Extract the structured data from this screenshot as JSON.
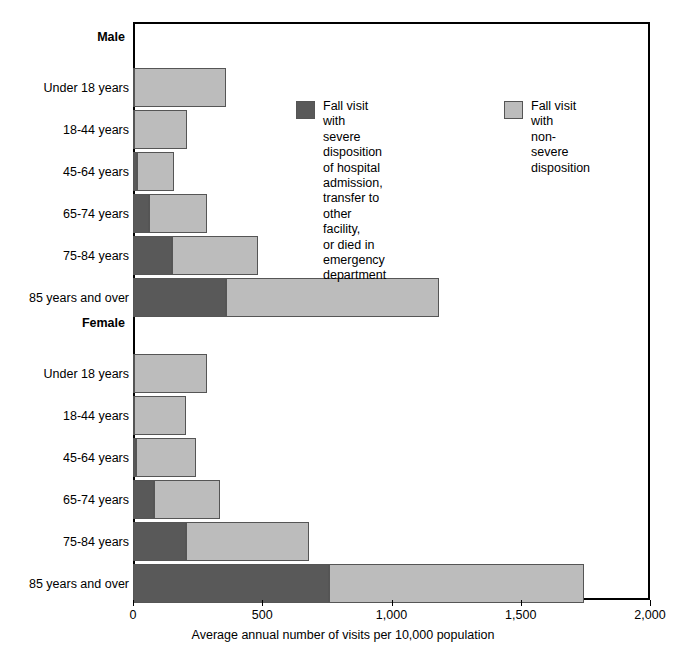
{
  "axis": {
    "x_title": "Average annual number of visits per 10,000 population",
    "ticks": [
      "0",
      "500",
      "1,000",
      "1,500",
      "2,000"
    ]
  },
  "legend": {
    "severe_label": "Fall visit with\nsevere disposition\nof hospital admission,\ntransfer to other facility,\nor died in emergency\ndepartment",
    "nonsevere_label": "Fall visit with\nnon-severe disposition",
    "severe_color": "#595959",
    "nonsevere_color": "#bcbcbc"
  },
  "groups": [
    {
      "name": "Male"
    },
    {
      "name": "Female"
    }
  ],
  "categories": [
    "Under 18 years",
    "18-44 years",
    "45-64 years",
    "65-74 years",
    "75-84 years",
    "85 years and over"
  ],
  "chart_data": {
    "type": "bar",
    "orientation": "horizontal",
    "stacked": true,
    "title": "",
    "xlabel": "Average annual number of visits per 10,000 population",
    "ylabel": "",
    "xlim": [
      0,
      2000
    ],
    "xticks": [
      0,
      500,
      1000,
      1500,
      2000
    ],
    "xticklabels": [
      "0",
      "500",
      "1,000",
      "1,500",
      "2,000"
    ],
    "grid": false,
    "legend_position": "inside-upper-right",
    "group_labels": [
      "Male",
      "Female"
    ],
    "categories": [
      "Under 18 years",
      "18-44 years",
      "45-64 years",
      "65-74 years",
      "75-84 years",
      "85 years and over"
    ],
    "series": [
      {
        "name": "Fall visit with severe disposition of hospital admission, transfer to other facility, or died in emergency department",
        "color": "#595959",
        "values": {
          "Male": [
            5,
            5,
            15,
            60,
            150,
            360
          ],
          "Female": [
            5,
            5,
            10,
            80,
            205,
            760
          ]
        }
      },
      {
        "name": "Fall visit with non-severe disposition",
        "color": "#bcbcbc",
        "values": {
          "Male": [
            355,
            205,
            145,
            225,
            335,
            825
          ],
          "Female": [
            280,
            200,
            235,
            255,
            475,
            985
          ]
        }
      }
    ],
    "totals": {
      "Male": [
        360,
        210,
        160,
        285,
        485,
        1185
      ],
      "Female": [
        285,
        205,
        245,
        335,
        680,
        1745
      ]
    }
  },
  "layout": {
    "male_rows_top": [
      46,
      88,
      130,
      172,
      214,
      256
    ],
    "female_rows_top": [
      332,
      374,
      416,
      458,
      500,
      542
    ],
    "male_group_label_top": 30,
    "female_group_label_top": 316
  }
}
